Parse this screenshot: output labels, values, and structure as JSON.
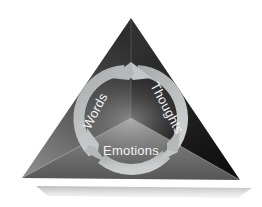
{
  "diagram": {
    "shape": "triangle-pyramid",
    "background_color": "#ffffff",
    "triangle": {
      "apex": [
        131,
        18
      ],
      "left_corner": [
        22,
        178
      ],
      "right_corner": [
        240,
        180
      ],
      "center": [
        131,
        118
      ],
      "face_colors": {
        "top_left": "#4a4a4a",
        "top_right": "#1b1b1b",
        "bottom": "#6e6e6e"
      },
      "shadow_color": "#c9c9c9"
    },
    "ring": {
      "center": [
        131,
        118
      ],
      "radius": 48,
      "stroke_width": 11,
      "color": "#b9bdbd",
      "direction": "clockwise",
      "segments": 3
    },
    "labels": [
      {
        "id": "words",
        "text": "Words",
        "rotation": -62,
        "x": 99,
        "y": 113,
        "color": "#f2f2f2"
      },
      {
        "id": "thoughts",
        "text": "Thoughts",
        "rotation": 62,
        "x": 163,
        "y": 110,
        "color": "#f2f2f2"
      },
      {
        "id": "emotions",
        "text": "Emotions",
        "rotation": 0,
        "x": 131,
        "y": 155,
        "color": "#f2f2f2"
      }
    ],
    "arrowheads": [
      {
        "id": "top",
        "position": "12-oclock",
        "angle_deg": 270
      },
      {
        "id": "bottom-right",
        "position": "4-oclock",
        "angle_deg": 30
      },
      {
        "id": "bottom-left",
        "position": "8-oclock",
        "angle_deg": 150
      }
    ]
  }
}
